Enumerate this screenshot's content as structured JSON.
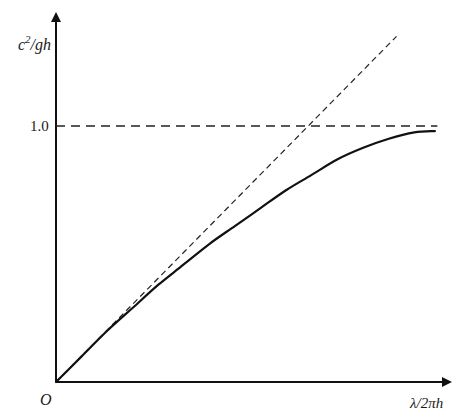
{
  "chart_data": {
    "type": "line",
    "title": "",
    "xlabel": "λ/2πh",
    "ylabel": "c²/gh",
    "origin_label": "O",
    "y_ticks": [
      {
        "value": 1.0,
        "label": "1.0"
      }
    ],
    "x_ticks": [],
    "xlim": [
      0,
      1.55
    ],
    "ylim": [
      0,
      1.45
    ],
    "grid": false,
    "legend": null,
    "series": [
      {
        "name": "c²/gh (tanh dispersion curve)",
        "style": "solid",
        "x": [
          0.0,
          0.1,
          0.2,
          0.3,
          0.4,
          0.5,
          0.6,
          0.7,
          0.8,
          0.9,
          1.0,
          1.1,
          1.2,
          1.3,
          1.4,
          1.48
        ],
        "values": [
          0.0,
          0.1,
          0.2,
          0.29,
          0.38,
          0.46,
          0.54,
          0.61,
          0.68,
          0.75,
          0.81,
          0.87,
          0.915,
          0.95,
          0.975,
          0.98
        ]
      },
      {
        "name": "shallow-water asymptote c²/gh = λ/2πh",
        "style": "dashed",
        "x": [
          0.0,
          1.33
        ],
        "values": [
          0.0,
          1.35
        ]
      },
      {
        "name": "deep-water limit c²/gh = 1",
        "style": "dashed",
        "x": [
          0.0,
          1.49
        ],
        "values": [
          1.0,
          1.0
        ]
      }
    ]
  },
  "axes": {
    "y_label_main": "c",
    "y_label_sup": "2",
    "y_label_rest": "/gh",
    "x_label": "λ/2πh",
    "origin": "O",
    "tick_1": "1.0"
  }
}
